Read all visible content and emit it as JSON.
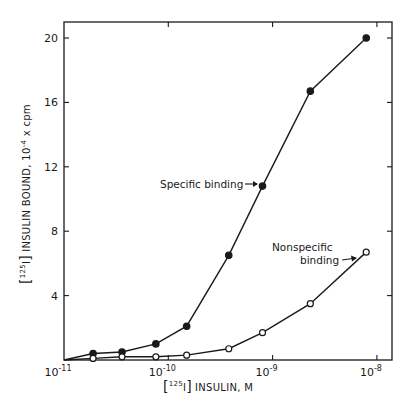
{
  "chart_data": {
    "type": "line",
    "title": "",
    "xlabel": "[125I] INSULIN, M",
    "xlabel_parts": {
      "bracket_open": "[",
      "superscript": "125",
      "element": "I",
      "bracket_close": "]",
      "rest": "INSULIN, M"
    },
    "ylabel": "[125I] INSULIN BOUND, 10^-4 x cpm",
    "ylabel_parts": {
      "bracket_open": "[",
      "superscript": "125",
      "element": "I",
      "bracket_close": "]",
      "rest": "INSULIN BOUND, 10",
      "exp": "-4",
      "tail": " x cpm"
    },
    "xscale": "log",
    "xlim": [
      1e-11,
      1.2e-08
    ],
    "ylim": [
      0,
      21
    ],
    "grid": false,
    "x_ticks": [
      {
        "value": 1e-11,
        "base": "10",
        "exp": "-11"
      },
      {
        "value": 1e-10,
        "base": "10",
        "exp": "-10"
      },
      {
        "value": 1e-09,
        "base": "10",
        "exp": "-9"
      },
      {
        "value": 1e-08,
        "base": "10",
        "exp": "-8"
      }
    ],
    "y_ticks": [
      4,
      8,
      12,
      16,
      20
    ],
    "series": [
      {
        "name": "Specific binding",
        "marker": "filled-circle",
        "x": [
          1e-11,
          1.9e-11,
          3.6e-11,
          7.6e-11,
          1.5e-10,
          3.8e-10,
          8e-10,
          2.3e-09,
          7.9e-09
        ],
        "values": [
          0,
          0.4,
          0.5,
          1.0,
          2.1,
          6.5,
          10.8,
          16.7,
          20.0
        ],
        "marker_from_index": 1
      },
      {
        "name": "Nonspecific binding",
        "marker": "open-circle",
        "x": [
          1e-11,
          1.9e-11,
          3.6e-11,
          7.6e-11,
          1.5e-10,
          3.8e-10,
          8e-10,
          2.3e-09,
          7.9e-09
        ],
        "values": [
          0,
          0.1,
          0.2,
          0.2,
          0.3,
          0.7,
          1.7,
          3.5,
          6.7
        ],
        "marker_from_index": 1
      }
    ],
    "annotations": [
      {
        "text": "Specific binding",
        "target_series": 0,
        "arrow": true
      },
      {
        "text_line1": "Nonspecific",
        "text_line2": "binding",
        "target_series": 1,
        "arrow": true
      }
    ]
  }
}
